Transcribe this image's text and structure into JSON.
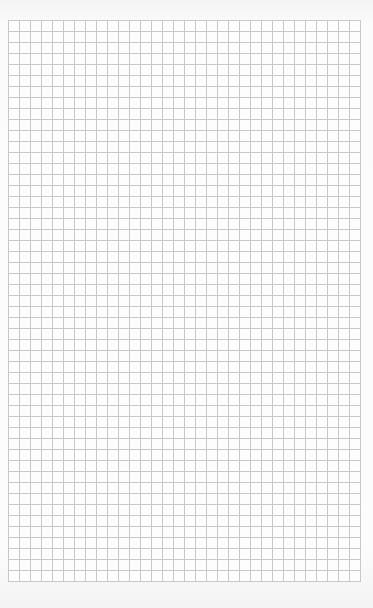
{
  "image": {
    "subject": "graph-paper-sheet",
    "paper_color": "#fcfcfc",
    "grid_line_color": "#c9c9c9",
    "grid": {
      "columns": 32,
      "rows": 51,
      "cell_size_px": 11
    }
  }
}
